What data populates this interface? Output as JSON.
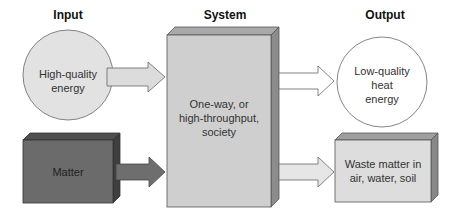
{
  "headers": {
    "input": "Input",
    "system": "System",
    "output": "Output"
  },
  "nodes": {
    "input_energy": {
      "label": "High-quality\nenergy",
      "shape": "circle",
      "fill": "#e2e2e2"
    },
    "input_matter": {
      "label": "Matter",
      "shape": "box",
      "fill": "#6b6b6b"
    },
    "system": {
      "label": "One-way, or\nhigh-throughput,\nsociety",
      "shape": "box",
      "fill": "#cfcfcf"
    },
    "output_energy": {
      "label": "Low-quality\nheat\nenergy",
      "shape": "circle",
      "fill": "#ffffff"
    },
    "output_waste": {
      "label": "Waste matter in\nair, water, soil",
      "shape": "box",
      "fill": "#dddddd"
    }
  },
  "edges": [
    {
      "from": "input_energy",
      "to": "system",
      "fill": "#dcdcdc"
    },
    {
      "from": "input_matter",
      "to": "system",
      "fill": "#6e6e6e"
    },
    {
      "from": "system",
      "to": "output_energy",
      "fill": "#ffffff"
    },
    {
      "from": "system",
      "to": "output_waste",
      "fill": "#e6e6e6"
    }
  ]
}
